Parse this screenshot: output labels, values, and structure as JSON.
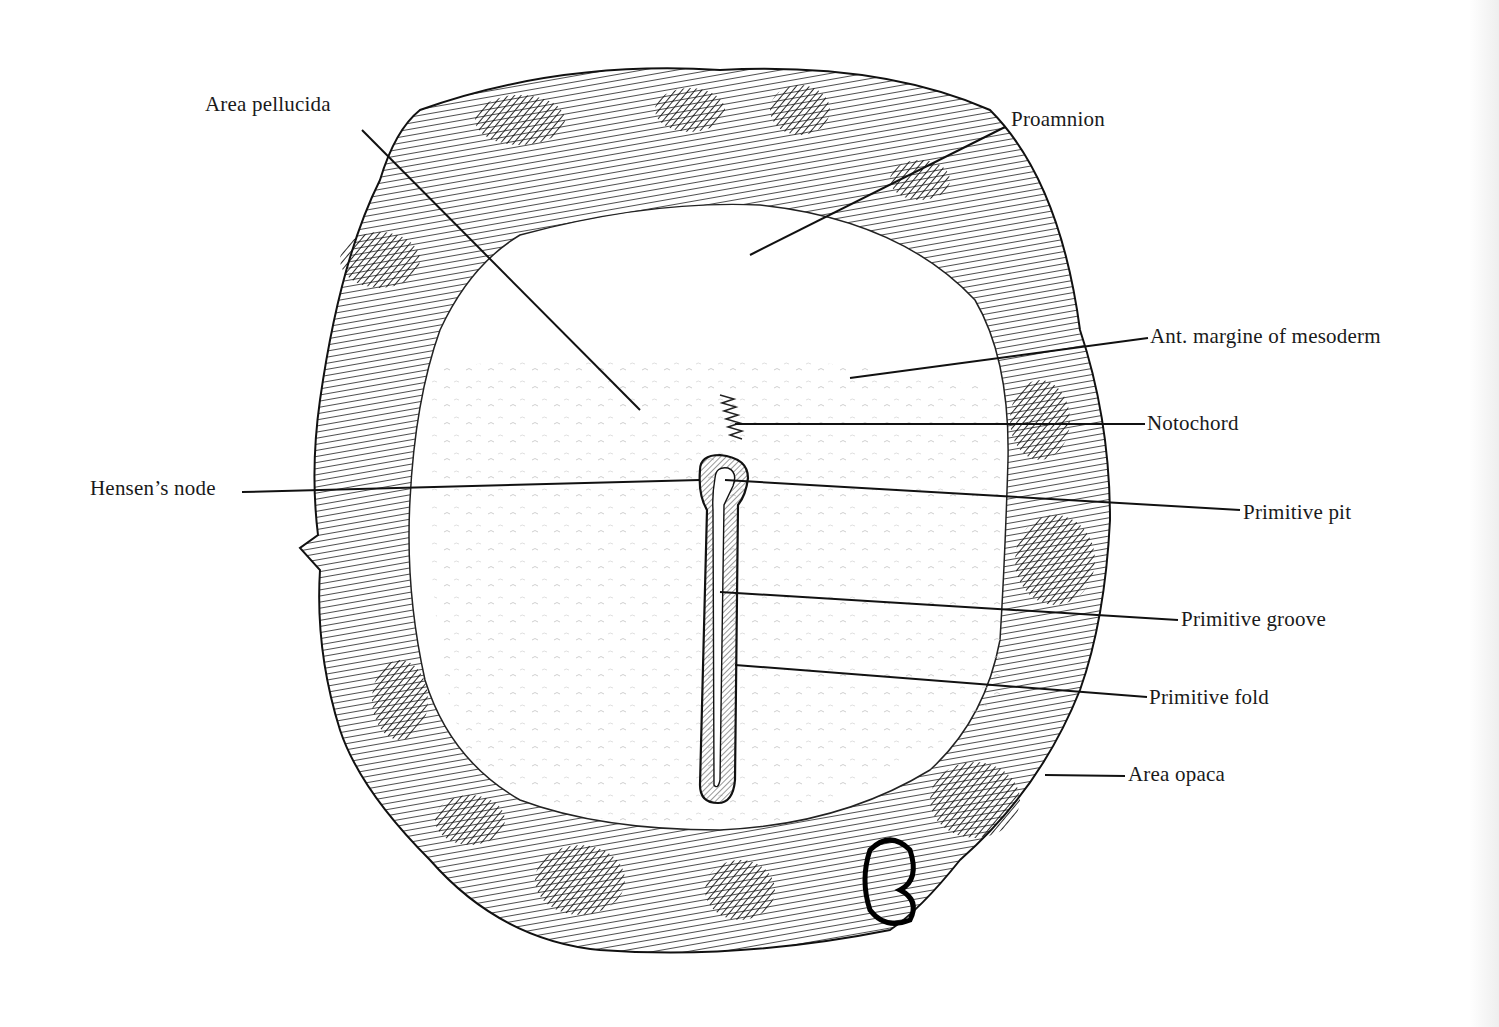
{
  "figure": {
    "labels": [
      {
        "id": "area-pellucida",
        "text": "Area pellucida",
        "x": 205,
        "y": 92,
        "line": [
          [
            362,
            130
          ],
          [
            640,
            410
          ]
        ]
      },
      {
        "id": "proamnion",
        "text": "Proamnion",
        "x": 1011,
        "y": 107,
        "line": [
          [
            1005,
            127
          ],
          [
            750,
            255
          ]
        ]
      },
      {
        "id": "ant-margin-mesoderm",
        "text": "Ant. margine of mesoderm",
        "x": 1150,
        "y": 324,
        "line": [
          [
            1148,
            338
          ],
          [
            850,
            378
          ]
        ]
      },
      {
        "id": "notochord",
        "text": "Notochord",
        "x": 1147,
        "y": 411,
        "line": [
          [
            1145,
            424
          ],
          [
            735,
            424
          ]
        ]
      },
      {
        "id": "hensens-node",
        "text": "Hensen’s node",
        "x": 90,
        "y": 476,
        "line": [
          [
            242,
            492
          ],
          [
            700,
            480
          ]
        ]
      },
      {
        "id": "primitive-pit",
        "text": "Primitive pit",
        "x": 1243,
        "y": 500,
        "line": [
          [
            1240,
            510
          ],
          [
            725,
            480
          ]
        ]
      },
      {
        "id": "primitive-groove",
        "text": "Primitive groove",
        "x": 1181,
        "y": 607,
        "line": [
          [
            1178,
            620
          ],
          [
            720,
            592
          ]
        ]
      },
      {
        "id": "primitive-fold",
        "text": "Primitive fold",
        "x": 1149,
        "y": 685,
        "line": [
          [
            1147,
            697
          ],
          [
            735,
            665
          ]
        ]
      },
      {
        "id": "area-opaca",
        "text": "Area opaca",
        "x": 1128,
        "y": 762,
        "line": [
          [
            1125,
            776
          ],
          [
            1045,
            775
          ]
        ]
      }
    ]
  },
  "colors": {
    "ink": "#1a1a1a",
    "paper": "#ffffff"
  }
}
